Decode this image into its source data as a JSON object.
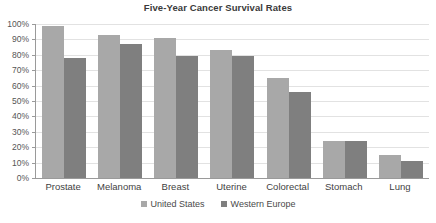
{
  "chart_data": {
    "type": "bar",
    "title": "Five-Year Cancer Survival Rates",
    "xlabel": "",
    "ylabel": "",
    "ylim": [
      0,
      100
    ],
    "y_ticks": [
      "0%",
      "10%",
      "20%",
      "30%",
      "40%",
      "50%",
      "60%",
      "70%",
      "80%",
      "90%",
      "100%"
    ],
    "y_tick_values": [
      0,
      10,
      20,
      30,
      40,
      50,
      60,
      70,
      80,
      90,
      100
    ],
    "grid": true,
    "legend_position": "bottom",
    "categories": [
      "Prostate",
      "Melanoma",
      "Breast",
      "Uterine",
      "Colorectal",
      "Stomach",
      "Lung"
    ],
    "series": [
      {
        "name": "United States",
        "color": "#a8a8a8",
        "values": [
          99,
          93,
          91,
          83,
          65,
          24,
          15
        ]
      },
      {
        "name": "Western Europe",
        "color": "#7f7f7f",
        "values": [
          78,
          87,
          79,
          79,
          56,
          24,
          11
        ]
      }
    ]
  }
}
